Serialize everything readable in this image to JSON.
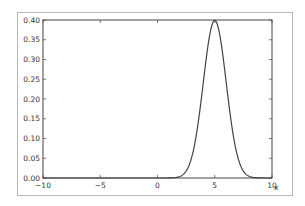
{
  "chart_data": {
    "type": "line",
    "title": "",
    "xlabel": "x",
    "ylabel": "",
    "xlim": [
      -10,
      10
    ],
    "ylim": [
      0.0,
      0.4
    ],
    "grid": false,
    "legend": null,
    "xticks": [
      -10,
      -5,
      0,
      5,
      10
    ],
    "xtick_labels": [
      "−10",
      "−5",
      "0",
      "5",
      "10"
    ],
    "yticks": [
      0.0,
      0.05,
      0.1,
      0.15,
      0.2,
      0.25,
      0.3,
      0.35,
      0.4
    ],
    "ytick_labels": [
      "0.00",
      "0.05",
      "0.10",
      "0.15",
      "0.20",
      "0.25",
      "0.30",
      "0.35",
      "0.40"
    ],
    "series": [
      {
        "name": "normal pdf (mean 5, sd 1)",
        "color": "#444444",
        "x": [
          -10,
          0,
          1,
          2,
          2.5,
          3,
          3.5,
          4,
          4.5,
          5,
          5.5,
          6,
          6.5,
          7,
          7.5,
          8,
          9,
          10
        ],
        "y": [
          0.0,
          0.0,
          0.0001,
          0.0044,
          0.0175,
          0.054,
          0.1295,
          0.242,
          0.3521,
          0.3989,
          0.3521,
          0.242,
          0.1295,
          0.054,
          0.0175,
          0.0044,
          0.0001,
          0.0
        ]
      }
    ]
  }
}
